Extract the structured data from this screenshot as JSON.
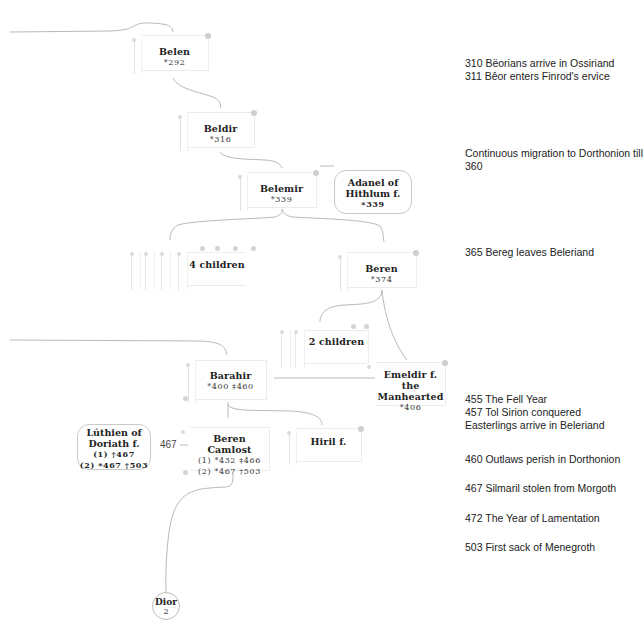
{
  "tree": {
    "nodes": {
      "belen": {
        "name": "Belen",
        "dates": "*292"
      },
      "beldir": {
        "name": "Beldir",
        "dates": "*316"
      },
      "belemir": {
        "name": "Belemir",
        "dates": "*339"
      },
      "adanel": {
        "name_line1": "Adanel of",
        "name_line2": "Hithlum f.",
        "dates": "*339"
      },
      "four_children": {
        "name": "4 children"
      },
      "beren_374": {
        "name": "Beren",
        "dates": "*374"
      },
      "two_children": {
        "name": "2 children"
      },
      "barahir": {
        "name": "Barahir",
        "dates": "*400 ‡460"
      },
      "emeldir": {
        "name_line1": "Emeldir f. the",
        "name_line2": "Manhearted",
        "dates": "*406"
      },
      "luthien": {
        "name_line1": "Lúthien of",
        "name_line2": "Doriath f.",
        "dates_line1": "(1) †467",
        "dates_line2": "(2) *467 †503"
      },
      "marriage_year": "467",
      "beren_camlost": {
        "name": "Beren Camlost",
        "dates_line1": "(1) *432 ‡466",
        "dates_line2": "(2) *467 †503"
      },
      "hiril": {
        "name": "Hiril f."
      },
      "dior": {
        "name": "Dior",
        "count": "2"
      }
    }
  },
  "timeline": [
    {
      "text": "310 Bëorians arrive in Ossiriand"
    },
    {
      "text": "311 Bêor enters Finrod's ervice"
    },
    {
      "text": "Continuous migration to Dorthonion till"
    },
    {
      "text": "360"
    },
    {
      "text": "365 Bereg leaves Beleriand"
    },
    {
      "text": "455 The Fell Year"
    },
    {
      "text": "457 Tol Sirion conquered"
    },
    {
      "text": "Easterlings arrive in Beleriand"
    },
    {
      "text": "460 Outlaws perish in Dorthonion"
    },
    {
      "text": "467 Silmaril stolen from Morgoth"
    },
    {
      "text": "472 The Year of Lamentation"
    },
    {
      "text": "503 First sack of Menegroth"
    }
  ],
  "colors": {
    "line": "#b9b9b9",
    "border": "#ececec",
    "pin": "#cfcfcf"
  }
}
